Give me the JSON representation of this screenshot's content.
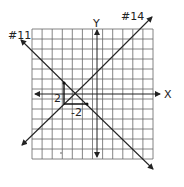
{
  "diagram": {
    "type": "coordinate-plane",
    "grid": {
      "columns": 12,
      "rows": 13
    },
    "axes": {
      "x_label": "X",
      "y_label": "Y"
    },
    "lines": [
      {
        "id": "#11",
        "label": "#11",
        "direction": "negative slope"
      },
      {
        "id": "#14",
        "label": "#14",
        "direction": "positive slope"
      }
    ],
    "slope_triangle": {
      "rise_label": "2",
      "run_label": "-2"
    },
    "colors": {
      "grid": "#555555",
      "line": "#222222",
      "background": "#ffffff"
    }
  }
}
